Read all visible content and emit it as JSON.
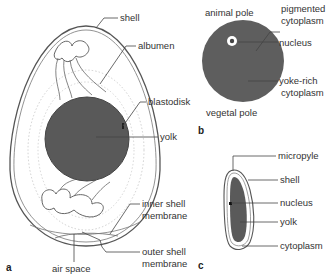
{
  "figure": {
    "panels": [
      {
        "id": "a",
        "panel_label": "a",
        "subject": "bird egg",
        "labels": {
          "shell": "shell",
          "albumen": "albumen",
          "blastodisk": "blastodisk",
          "yolk": "yolk",
          "inner_shell_membrane_1": "inner shell",
          "inner_shell_membrane_2": "membrane",
          "outer_shell_membrane_1": "outer shell",
          "outer_shell_membrane_2": "membrane",
          "air_space": "air space"
        }
      },
      {
        "id": "b",
        "panel_label": "b",
        "subject": "frog egg",
        "labels": {
          "animal_pole": "animal pole",
          "pigmented_cytoplasm_1": "pigmented",
          "pigmented_cytoplasm_2": "cytoplasm",
          "nucleus": "nucleus",
          "yoke_rich_1": "yoke-rich",
          "yoke_rich_2": "cytoplasm",
          "vegetal_pole": "vegetal pole"
        }
      },
      {
        "id": "c",
        "panel_label": "c",
        "subject": "insect egg",
        "labels": {
          "micropyle": "micropyle",
          "shell": "shell",
          "nucleus": "nucleus",
          "yolk": "yolk",
          "cytoplasm": "cytoplasm"
        }
      }
    ],
    "colors": {
      "yolk_fill": "#5a5a5a",
      "frog_egg_fill": "#5e5e5e",
      "line": "#444444",
      "text": "#333333"
    }
  }
}
